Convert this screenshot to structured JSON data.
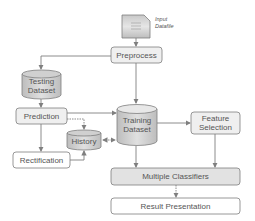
{
  "diagram": {
    "nodes": {
      "input": {
        "label_line1": "Input",
        "label_line2": "Datafile",
        "shape": "document"
      },
      "preprocess": {
        "label": "Preprocess",
        "shape": "rounded-rect"
      },
      "testing": {
        "label_line1": "Testing",
        "label_line2": "Dataset",
        "shape": "cylinder"
      },
      "prediction": {
        "label": "Prediction",
        "shape": "rounded-rect"
      },
      "training": {
        "label_line1": "Training",
        "label_line2": "Dataset",
        "shape": "cylinder"
      },
      "history": {
        "label": "History",
        "shape": "cylinder"
      },
      "rectification": {
        "label": "Rectification",
        "shape": "rounded-rect"
      },
      "feature": {
        "label_line1": "Feature",
        "label_line2": "Selection",
        "shape": "rounded-rect"
      },
      "classifiers": {
        "label": "Multiple Classifiers",
        "shape": "rounded-rect"
      },
      "result": {
        "label": "Result Presentation",
        "shape": "rounded-rect"
      }
    },
    "edges": [
      {
        "from": "input",
        "to": "preprocess"
      },
      {
        "from": "preprocess",
        "to": "testing"
      },
      {
        "from": "preprocess",
        "to": "training"
      },
      {
        "from": "testing",
        "to": "prediction"
      },
      {
        "from": "prediction",
        "to": "training"
      },
      {
        "from": "prediction",
        "to": "history",
        "style": "dotted"
      },
      {
        "from": "prediction",
        "to": "rectification"
      },
      {
        "from": "rectification",
        "to": "history"
      },
      {
        "from": "history",
        "to": "training",
        "style": "dotted",
        "bidirectional": true
      },
      {
        "from": "training",
        "to": "feature"
      },
      {
        "from": "training",
        "to": "classifiers"
      },
      {
        "from": "feature",
        "to": "classifiers"
      },
      {
        "from": "classifiers",
        "to": "result",
        "style": "dotted"
      }
    ],
    "colors": {
      "stroke": "#7f7f7f",
      "fill_gray": "#d9d9d9",
      "fill_light": "#efefef",
      "text": "#555555"
    }
  }
}
